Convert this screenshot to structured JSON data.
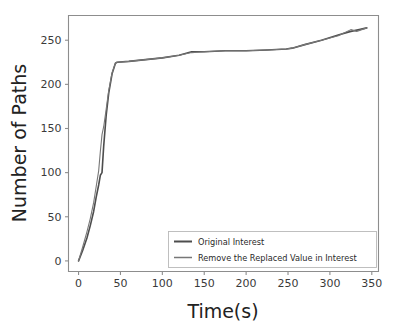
{
  "chart_data": {
    "type": "line",
    "title": "",
    "xlabel": "Time(s)",
    "ylabel": "Number of Paths",
    "xlim": [
      -12,
      358
    ],
    "ylim": [
      -12,
      278
    ],
    "xticks": [
      0,
      50,
      100,
      150,
      200,
      250,
      300,
      350
    ],
    "yticks": [
      0,
      50,
      100,
      150,
      200,
      250
    ],
    "grid": false,
    "legend_position": "lower right",
    "series": [
      {
        "name": "Original Interest",
        "color": "#4d4d4d",
        "linewidth": 1.6,
        "x": [
          0,
          5,
          10,
          14,
          18,
          21,
          24,
          26,
          28,
          30,
          33,
          36,
          40,
          44,
          46,
          60,
          80,
          100,
          120,
          135,
          150,
          175,
          200,
          225,
          248,
          255,
          270,
          290,
          310,
          325,
          335,
          344
        ],
        "y": [
          0,
          12,
          26,
          40,
          56,
          72,
          86,
          97,
          100,
          130,
          165,
          190,
          212,
          224,
          225,
          226,
          228,
          230,
          233,
          237,
          237,
          238,
          238,
          239,
          240,
          241,
          245,
          250,
          256,
          260,
          262,
          264
        ]
      },
      {
        "name": "Remove the Replaced Value in Interest",
        "color": "#777777",
        "linewidth": 1.1,
        "x": [
          0,
          5,
          10,
          14,
          18,
          21,
          24,
          26,
          28,
          30,
          33,
          36,
          40,
          44,
          46,
          60,
          80,
          100,
          120,
          135,
          150,
          175,
          200,
          225,
          248,
          255,
          270,
          290,
          310,
          325,
          332,
          338,
          344
        ],
        "y": [
          0,
          16,
          33,
          48,
          66,
          84,
          102,
          124,
          143,
          152,
          172,
          193,
          213,
          224,
          225,
          226,
          228,
          230,
          233,
          236,
          237,
          238,
          238,
          239,
          240,
          241,
          245,
          250,
          255,
          262,
          260,
          262,
          264
        ]
      }
    ],
    "legend_entries": [
      {
        "label": "Original Interest"
      },
      {
        "label": "Remove the Replaced Value in Interest"
      }
    ]
  }
}
